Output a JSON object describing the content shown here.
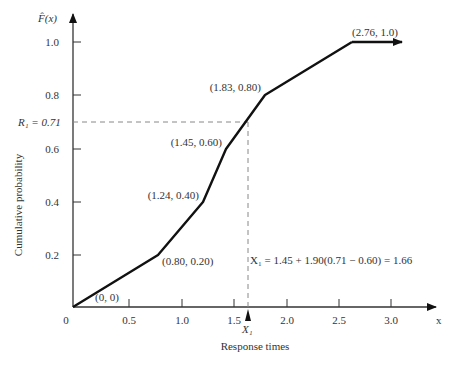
{
  "chart_data": {
    "type": "line",
    "title": "",
    "xlabel": "Response times",
    "ylabel": "Cumulative probability",
    "y_axis_title": "F̂(x)",
    "x_axis_end_label": "x",
    "xlim": [
      0,
      3.2
    ],
    "ylim": [
      0,
      1.1
    ],
    "grid": false,
    "legend": null,
    "x_ticks": [
      "0",
      "0.5",
      "1.0",
      "1.5",
      "2.0",
      "2.5",
      "3.0"
    ],
    "y_ticks": [
      "0.2",
      "0.4",
      "0.6",
      "0.8",
      "1.0"
    ],
    "series": [
      {
        "name": "Empirical CDF F̂(x)",
        "points": [
          {
            "x": 0,
            "y": 0,
            "label": "(0, 0)"
          },
          {
            "x": 0.8,
            "y": 0.2,
            "label": "(0.80, 0.20)"
          },
          {
            "x": 1.24,
            "y": 0.4,
            "label": "(1.24, 0.40)"
          },
          {
            "x": 1.45,
            "y": 0.6,
            "label": "(1.45, 0.60)"
          },
          {
            "x": 1.83,
            "y": 0.8,
            "label": "(1.83, 0.80)"
          },
          {
            "x": 2.76,
            "y": 1.0,
            "label": "(2.76, 1.0)"
          }
        ],
        "extends_right_with_arrow": true
      }
    ],
    "annotations": {
      "r1_label": "R₁ = 0.71",
      "r1_value": 0.71,
      "x1_value": 1.66,
      "x1_axis_label": "X₁",
      "x1_equation": "X₁ = 1.45 + 1.90(0.71 − 0.60) = 1.66"
    }
  },
  "layout": {
    "origin": [
      73,
      307
    ],
    "vertices_px": [
      [
        73,
        307
      ],
      [
        158,
        255
      ],
      [
        203,
        202
      ],
      [
        226,
        149
      ],
      [
        265,
        95
      ],
      [
        352,
        42
      ]
    ],
    "arrow_end_px": [
      402,
      42
    ],
    "x_tick_px": [
      73,
      129,
      182,
      234,
      287,
      339,
      391
    ],
    "y_tick_px": [
      255,
      202,
      149,
      95,
      42
    ],
    "r1_y_px": 122,
    "x1_x_px": 248
  }
}
